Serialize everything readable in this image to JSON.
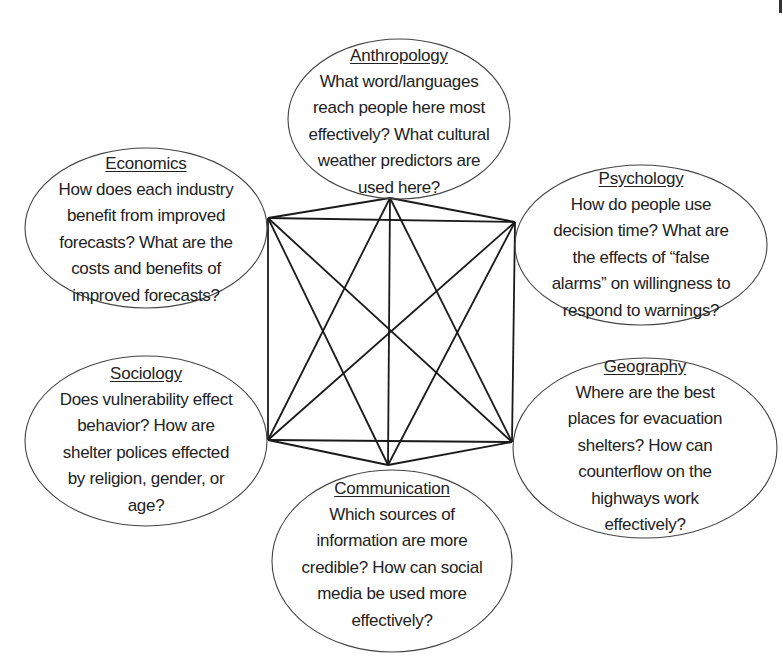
{
  "diagram": {
    "type": "complete-graph-concept-map",
    "line_color": "#1a1a1a",
    "ellipse_stroke": "#444444",
    "text_color": "#222222",
    "nodes": [
      {
        "id": "anthropology",
        "title": "Anthropology",
        "text": "What word/languages\nreach people here most\neffectively? What cultural\nweather predictors are\nused here?",
        "ellipse": {
          "cx": 399,
          "cy": 119,
          "rx": 111,
          "ry": 80
        },
        "anchor": {
          "x": 390,
          "y": 198
        },
        "box": {
          "left": 288,
          "top": 52,
          "width": 222,
          "height": 140
        }
      },
      {
        "id": "economics",
        "title": "Economics",
        "text": "How does each industry\nbenefit from improved\nforecasts? What are the\ncosts and benefits of\nimproved forecasts?",
        "ellipse": {
          "cx": 146,
          "cy": 228,
          "rx": 121,
          "ry": 80
        },
        "anchor": {
          "x": 268,
          "y": 218
        },
        "box": {
          "left": 30,
          "top": 160,
          "width": 232,
          "height": 140
        }
      },
      {
        "id": "psychology",
        "title": "Psychology",
        "text": "How do people use\ndecision time? What are\nthe effects of “false\nalarms” on willingness to\nrespond to warnings?",
        "ellipse": {
          "cx": 641,
          "cy": 245,
          "rx": 126,
          "ry": 80
        },
        "anchor": {
          "x": 515,
          "y": 222
        },
        "box": {
          "left": 520,
          "top": 175,
          "width": 242,
          "height": 140
        }
      },
      {
        "id": "sociology",
        "title": "Sociology",
        "text": "Does vulnerability effect\nbehavior? How are\nshelter polices effected\nby religion, gender, or\nage?",
        "ellipse": {
          "cx": 146,
          "cy": 441,
          "rx": 121,
          "ry": 85
        },
        "anchor": {
          "x": 268,
          "y": 440
        },
        "box": {
          "left": 30,
          "top": 370,
          "width": 232,
          "height": 140
        }
      },
      {
        "id": "geography",
        "title": "Geography",
        "text": "Where are the best\nplaces for evacuation\nshelters? How can\ncounterflow on the\nhighways work\neffectively?",
        "ellipse": {
          "cx": 645,
          "cy": 448,
          "rx": 132,
          "ry": 90
        },
        "anchor": {
          "x": 512,
          "y": 442
        },
        "box": {
          "left": 525,
          "top": 363,
          "width": 240,
          "height": 166
        }
      },
      {
        "id": "communication",
        "title": "Communication",
        "text": "Which sources of\ninformation are more\ncredible? How can social\nmedia be used more\neffectively?",
        "ellipse": {
          "cx": 392,
          "cy": 561,
          "rx": 120,
          "ry": 91
        },
        "anchor": {
          "x": 388,
          "y": 465
        },
        "box": {
          "left": 276,
          "top": 485,
          "width": 232,
          "height": 140
        }
      }
    ],
    "edges": [
      [
        "anthropology",
        "economics"
      ],
      [
        "anthropology",
        "psychology"
      ],
      [
        "anthropology",
        "sociology"
      ],
      [
        "anthropology",
        "geography"
      ],
      [
        "anthropology",
        "communication"
      ],
      [
        "economics",
        "psychology"
      ],
      [
        "economics",
        "sociology"
      ],
      [
        "economics",
        "geography"
      ],
      [
        "economics",
        "communication"
      ],
      [
        "psychology",
        "sociology"
      ],
      [
        "psychology",
        "geography"
      ],
      [
        "psychology",
        "communication"
      ],
      [
        "sociology",
        "geography"
      ],
      [
        "sociology",
        "communication"
      ],
      [
        "geography",
        "communication"
      ]
    ]
  }
}
